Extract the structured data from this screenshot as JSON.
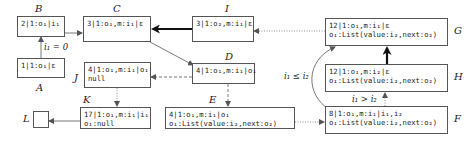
{
  "diagram": {
    "nodes": [
      {
        "id": "A",
        "label": "A",
        "lines": [
          "1|1:o₁|ε"
        ]
      },
      {
        "id": "B",
        "label": "B",
        "lines": [
          "2|1:o₁|i₁"
        ]
      },
      {
        "id": "C",
        "label": "C",
        "lines": [
          "3|1:o₁,m:i₁|ε"
        ]
      },
      {
        "id": "I",
        "label": "I",
        "lines": [
          "3|1:o₂,m:i₁|ε"
        ]
      },
      {
        "id": "D",
        "label": "D",
        "lines": [
          "4|1:o₁,m:i₁|o₁"
        ]
      },
      {
        "id": "J",
        "label": "J",
        "lines": [
          "4|1:o₁,m:i₁|o₁",
          "null"
        ]
      },
      {
        "id": "E",
        "label": "E",
        "lines": [
          "4|1:o₁,m:i₁|o₁",
          "o₁:List(value:i₂,next:o₂)"
        ]
      },
      {
        "id": "K",
        "label": "K",
        "lines": [
          "17|1:o₁,m:i₁|i₁",
          "o₁:null"
        ]
      },
      {
        "id": "L",
        "label": "L",
        "lines": []
      },
      {
        "id": "G",
        "label": "G",
        "lines": [
          "12|1:o₁,m:i₁|ε",
          "o₁:List(value:i₂,next:o₂)"
        ]
      },
      {
        "id": "H",
        "label": "H",
        "lines": [
          "12|1:o₁,m:i₂|ε",
          "o₁:List(value:i₂,next:o₂)"
        ]
      },
      {
        "id": "F",
        "label": "F",
        "lines": [
          "8|1:o₁,m:i₁|i₁,i₂",
          "o₁:List(value:i₂,next:o₂)"
        ]
      }
    ],
    "edges": [
      {
        "from": "A",
        "to": "B",
        "style": "solid",
        "label": "i₁ = 0"
      },
      {
        "from": "B",
        "to": "C",
        "style": "solid",
        "label": ""
      },
      {
        "from": "I",
        "to": "C",
        "style": "bold",
        "label": ""
      },
      {
        "from": "C",
        "to": "D",
        "style": "solid",
        "label": ""
      },
      {
        "from": "D",
        "to": "J",
        "style": "dashed",
        "label": ""
      },
      {
        "from": "D",
        "to": "E",
        "style": "dashed",
        "label": ""
      },
      {
        "from": "J",
        "to": "K",
        "style": "dotted",
        "label": ""
      },
      {
        "from": "K",
        "to": "L",
        "style": "solid",
        "label": ""
      },
      {
        "from": "E",
        "to": "F",
        "style": "dotted",
        "label": ""
      },
      {
        "from": "G",
        "to": "I",
        "style": "dotted",
        "label": ""
      },
      {
        "from": "F",
        "to": "H",
        "style": "dotted",
        "label": "i₁ > i₂"
      },
      {
        "from": "H",
        "to": "G",
        "style": "bold",
        "label": ""
      },
      {
        "from": "F",
        "to": "G",
        "style": "curved",
        "label": "i₁ ≤ i₂"
      }
    ],
    "conditions": {
      "a_to_b": "i₁ = 0",
      "f_to_h": "i₁ > i₂",
      "f_to_g": "i₁ ≤ i₂"
    }
  }
}
